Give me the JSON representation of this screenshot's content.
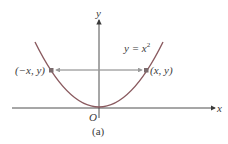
{
  "diagram": {
    "axis_x_label": "x",
    "axis_y_label": "y",
    "origin_label": "O",
    "equation_label": "y = x",
    "equation_exponent": "2",
    "point_left_label": "(−x, y)",
    "point_right_label": "(x, y)",
    "caption": "(a)",
    "colors": {
      "curve": "#8a5a5f",
      "axes": "#3a3a3a",
      "arrow": "#9a9a9a",
      "point": "#7a6a6c"
    }
  }
}
